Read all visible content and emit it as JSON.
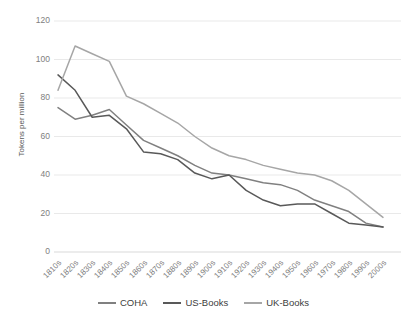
{
  "chart_data": {
    "type": "line",
    "title": "",
    "xlabel": "",
    "ylabel": "Tokens per million",
    "ylim": [
      0,
      120
    ],
    "ytick_step": 20,
    "yticks": [
      "0",
      "20",
      "40",
      "60",
      "80",
      "100",
      "120"
    ],
    "grid": true,
    "legend_position": "bottom",
    "categories": [
      "1810s",
      "1820s",
      "1830s",
      "1840s",
      "1850s",
      "1860s",
      "1870s",
      "1880s",
      "1890s",
      "1900s",
      "1910s",
      "1920s",
      "1930s",
      "1940s",
      "1950s",
      "1960s",
      "1970s",
      "1980s",
      "1990s",
      "2000s"
    ],
    "series": [
      {
        "name": "COHA",
        "color": "#808080",
        "values": [
          75,
          69,
          71,
          74,
          66,
          58,
          54,
          50,
          45,
          41,
          40,
          38,
          36,
          35,
          32,
          27,
          24,
          21,
          15,
          13
        ]
      },
      {
        "name": "US-Books",
        "color": "#595959",
        "values": [
          92,
          84,
          70,
          71,
          64,
          52,
          51,
          48,
          41,
          38,
          40,
          32,
          27,
          24,
          25,
          25,
          20,
          15,
          14,
          13
        ]
      },
      {
        "name": "UK-Books",
        "color": "#A6A6A6",
        "values": [
          84,
          107,
          103,
          99,
          81,
          77,
          72,
          67,
          60,
          54,
          50,
          48,
          45,
          43,
          41,
          40,
          37,
          32,
          25,
          18
        ]
      }
    ]
  },
  "legend": {
    "items": [
      {
        "label": "COHA"
      },
      {
        "label": "US-Books"
      },
      {
        "label": "UK-Books"
      }
    ]
  },
  "axis": {
    "y_title": "Tokens per million"
  }
}
